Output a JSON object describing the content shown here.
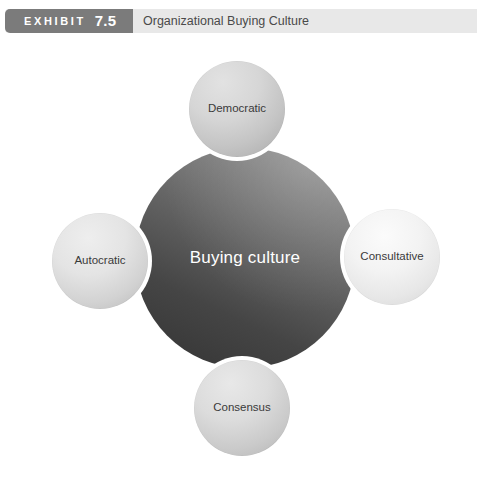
{
  "header": {
    "exhibit_word": "EXHIBIT",
    "exhibit_number": "7.5",
    "title": "Organizational Buying Culture",
    "badge_color": "#7b7b7b",
    "strip_color": "#e8e8e8"
  },
  "diagram": {
    "core": {
      "label": "Buying culture",
      "text_color": "#ffffff",
      "gradient_from": "#9b9b9b",
      "gradient_to": "#383838"
    },
    "nodes": [
      {
        "id": "democratic",
        "label": "Democratic",
        "position": "top"
      },
      {
        "id": "autocratic",
        "label": "Autocratic",
        "position": "left"
      },
      {
        "id": "consultative",
        "label": "Consultative",
        "position": "right"
      },
      {
        "id": "consensus",
        "label": "Consensus",
        "position": "bottom"
      }
    ]
  }
}
